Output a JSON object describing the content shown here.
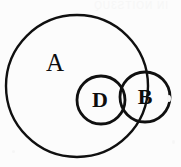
{
  "figure": {
    "background_color": "#fcfcfc",
    "stroke_color": "#101010",
    "bleed_text": "IN NOITS3UQ"
  },
  "chart_data": {
    "type": "diagram",
    "diagram_kind": "venn",
    "title": "",
    "xlabel": "",
    "ylabel": "",
    "canvas": {
      "width": 181,
      "height": 167
    },
    "sets": [
      {
        "label": "A",
        "cx": 77,
        "cy": 86,
        "r": 71,
        "stroke_width": 2.4,
        "label_x": 55,
        "label_y": 63,
        "font_size": 25,
        "bold": false
      },
      {
        "label": "D",
        "cx": 101,
        "cy": 100,
        "r": 24,
        "stroke_width": 2.8,
        "label_x": 100,
        "label_y": 100,
        "font_size": 22,
        "bold": true
      },
      {
        "label": "B",
        "cx": 145,
        "cy": 97,
        "r": 25,
        "stroke_width": 2.8,
        "label_x": 145,
        "label_y": 97,
        "font_size": 22,
        "bold": true
      }
    ],
    "relations": [
      "D is contained within A",
      "B overlaps D",
      "B crosses the boundary of A, lying partly inside and partly outside A"
    ],
    "labels": [
      "A",
      "D",
      "B"
    ],
    "legend": [],
    "grid": false
  }
}
